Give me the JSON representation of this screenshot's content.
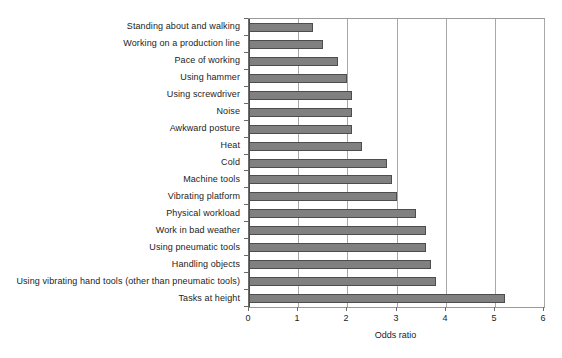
{
  "chart_data": {
    "type": "bar",
    "orientation": "horizontal",
    "title": "",
    "xlabel": "Odds ratio",
    "ylabel": "",
    "xlim": [
      0,
      6
    ],
    "xticks": [
      0,
      1,
      2,
      3,
      4,
      5,
      6
    ],
    "xtick_labels": [
      "0",
      "1",
      "2",
      "3",
      "4",
      "5",
      "6"
    ],
    "grid": "vertical",
    "legend": "none",
    "bar_color": "#808080",
    "bar_edge_color": "#4d4d4d",
    "categories": [
      "Standing about and walking",
      "Working on a production line",
      "Pace of working",
      "Using hammer",
      "Using screwdriver",
      "Noise",
      "Awkward posture",
      "Heat",
      "Cold",
      "Machine tools",
      "Vibrating platform",
      "Physical workload",
      "Work in bad weather",
      "Using pneumatic tools",
      "Handling objects",
      "Using vibrating hand tools (other than pneumatic tools)",
      "Tasks at height"
    ],
    "values": [
      1.3,
      1.5,
      1.8,
      2.0,
      2.1,
      2.1,
      2.1,
      2.3,
      2.8,
      2.9,
      3.0,
      3.4,
      3.6,
      3.6,
      3.7,
      3.8,
      5.2
    ]
  }
}
